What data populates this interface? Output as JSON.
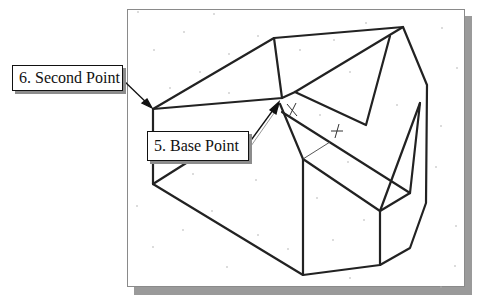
{
  "figure": {
    "caption_partial": "",
    "frame": {
      "background": "#ffffff",
      "border": "#8a8a8a",
      "shadow": "#9a9a9a"
    },
    "line_color": "#222222"
  },
  "callouts": [
    {
      "id": "second-point",
      "label": "6. Second Point",
      "box": [
        12,
        65,
        111,
        26
      ],
      "arrow_from": [
        123,
        78
      ],
      "arrow_to": [
        152,
        108
      ]
    },
    {
      "id": "base-point",
      "label": "5. Base Point",
      "box": [
        147,
        131,
        102,
        30
      ],
      "arrow_from": [
        249,
        141
      ],
      "arrow_to": [
        278,
        103
      ]
    }
  ],
  "markers": [
    {
      "type": "cross",
      "x": 292,
      "y": 110
    },
    {
      "type": "cross",
      "x": 337,
      "y": 131
    }
  ]
}
